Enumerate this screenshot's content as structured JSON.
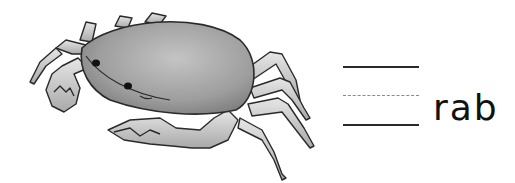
{
  "worksheet": {
    "illustration": "crab",
    "word_ending": "rab",
    "writing_lines": [
      "solid-top",
      "dashed-mid",
      "solid-baseline"
    ],
    "colors": {
      "outline": "#2a2a2a",
      "shell": "#9a9a9a",
      "leg": "#c8c8c8",
      "dashed": "#8a8a8a"
    }
  }
}
